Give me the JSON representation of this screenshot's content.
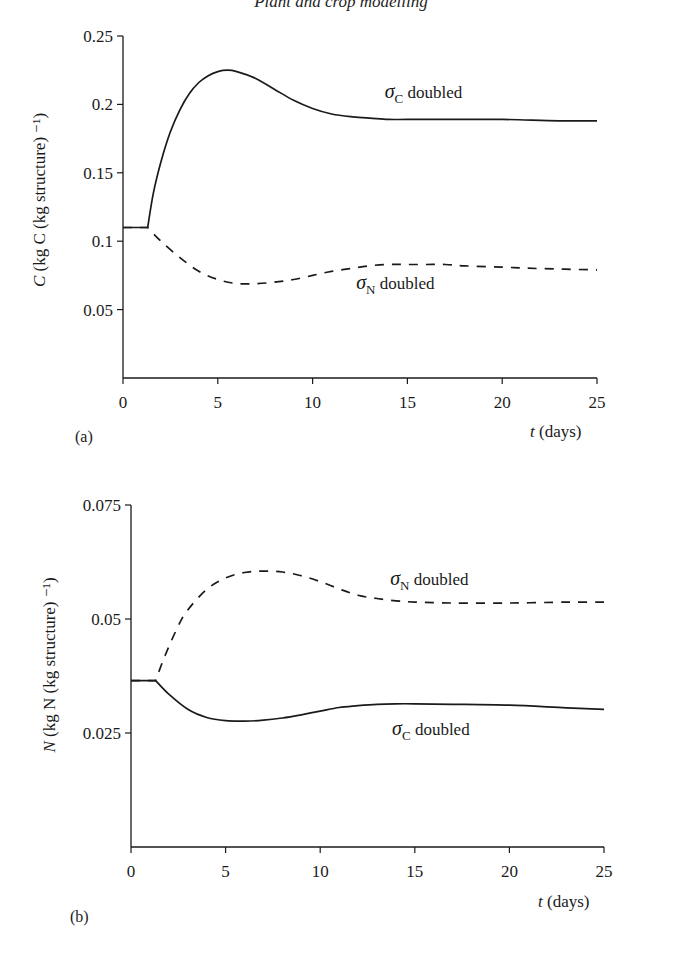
{
  "page": {
    "running_head": "Plant and crop modelling"
  },
  "chart_data": [
    {
      "type": "line",
      "panel": "(a)",
      "title": "",
      "xlabel_var": "t",
      "xlabel_unit": "(days)",
      "ylabel_var": "C",
      "ylabel_unit": "(kg C (kg structure) ⁻¹)",
      "xlim": [
        0,
        25
      ],
      "ylim": [
        0,
        0.25
      ],
      "xticks": [
        0,
        5,
        10,
        15,
        20,
        25
      ],
      "xtick_labels": [
        "0",
        "5",
        "10",
        "15",
        "20",
        "25"
      ],
      "yticks": [
        0.05,
        0.1,
        0.15,
        0.2,
        0.25
      ],
      "ytick_labels": [
        "0.05",
        "0.1",
        "0.15",
        "0.2",
        "0.25"
      ],
      "grid": false,
      "legend": "inline labels",
      "series": [
        {
          "name": "σC doubled",
          "label_sym": "σ",
          "label_sub": "C",
          "label_text": " doubled",
          "style": "solid",
          "label_pos": [
            13.8,
            0.205
          ],
          "x": [
            0,
            1.3,
            1.6,
            2,
            2.5,
            3,
            3.5,
            4,
            4.5,
            5,
            5.5,
            6,
            7,
            8,
            9,
            10,
            11,
            12,
            13,
            14,
            15,
            17,
            20,
            23,
            25
          ],
          "y": [
            0.11,
            0.11,
            0.135,
            0.158,
            0.18,
            0.196,
            0.208,
            0.216,
            0.221,
            0.224,
            0.225,
            0.224,
            0.219,
            0.211,
            0.203,
            0.197,
            0.193,
            0.191,
            0.19,
            0.189,
            0.189,
            0.189,
            0.189,
            0.188,
            0.188
          ]
        },
        {
          "name": "σN doubled",
          "label_sym": "σ",
          "label_sub": "N",
          "label_text": " doubled",
          "style": "dashed",
          "label_pos": [
            12.3,
            0.065
          ],
          "x": [
            0,
            1.3,
            2,
            3,
            4,
            5,
            6,
            7,
            8,
            9,
            10,
            11,
            12,
            13,
            14,
            15,
            16,
            17,
            18,
            20,
            22,
            25
          ],
          "y": [
            0.11,
            0.11,
            0.1,
            0.088,
            0.078,
            0.072,
            0.069,
            0.069,
            0.07,
            0.072,
            0.075,
            0.078,
            0.08,
            0.082,
            0.083,
            0.083,
            0.083,
            0.083,
            0.082,
            0.081,
            0.08,
            0.079
          ]
        }
      ]
    },
    {
      "type": "line",
      "panel": "(b)",
      "title": "",
      "xlabel_var": "t",
      "xlabel_unit": "(days)",
      "ylabel_var": "N",
      "ylabel_unit": "(kg N (kg structure) ⁻¹)",
      "xlim": [
        0,
        25
      ],
      "ylim": [
        0,
        0.075
      ],
      "xticks": [
        0,
        5,
        10,
        15,
        20,
        25
      ],
      "xtick_labels": [
        "0",
        "5",
        "10",
        "15",
        "20",
        "25"
      ],
      "yticks": [
        0.025,
        0.05,
        0.075
      ],
      "ytick_labels": [
        "0.025",
        "0.05",
        "0.075"
      ],
      "grid": false,
      "legend": "inline labels",
      "series": [
        {
          "name": "σN doubled",
          "label_sym": "σ",
          "label_sub": "N",
          "label_text": " doubled",
          "style": "dashed",
          "label_pos": [
            13.7,
            0.0575
          ],
          "x": [
            0,
            1.3,
            1.8,
            2.5,
            3,
            4,
            5,
            6,
            7,
            8,
            9,
            10,
            11,
            12,
            13,
            14,
            15,
            17,
            20,
            23,
            25
          ],
          "y": [
            0.0365,
            0.0365,
            0.042,
            0.0485,
            0.052,
            0.0565,
            0.059,
            0.0602,
            0.0605,
            0.0603,
            0.0595,
            0.0582,
            0.0566,
            0.0552,
            0.0545,
            0.054,
            0.0537,
            0.0535,
            0.0535,
            0.0537,
            0.0537
          ]
        },
        {
          "name": "σC doubled",
          "label_sym": "σ",
          "label_sub": "C",
          "label_text": " doubled",
          "style": "solid",
          "label_pos": [
            13.8,
            0.0245
          ],
          "x": [
            0,
            1.3,
            2,
            3,
            4,
            5,
            6,
            7,
            8,
            9,
            10,
            11,
            12,
            13,
            14,
            15,
            17,
            20,
            23,
            25
          ],
          "y": [
            0.0365,
            0.0365,
            0.0335,
            0.0302,
            0.0284,
            0.0277,
            0.0276,
            0.0278,
            0.0283,
            0.029,
            0.0298,
            0.0306,
            0.031,
            0.0313,
            0.0314,
            0.0314,
            0.0313,
            0.0311,
            0.0305,
            0.0302
          ]
        }
      ]
    }
  ]
}
